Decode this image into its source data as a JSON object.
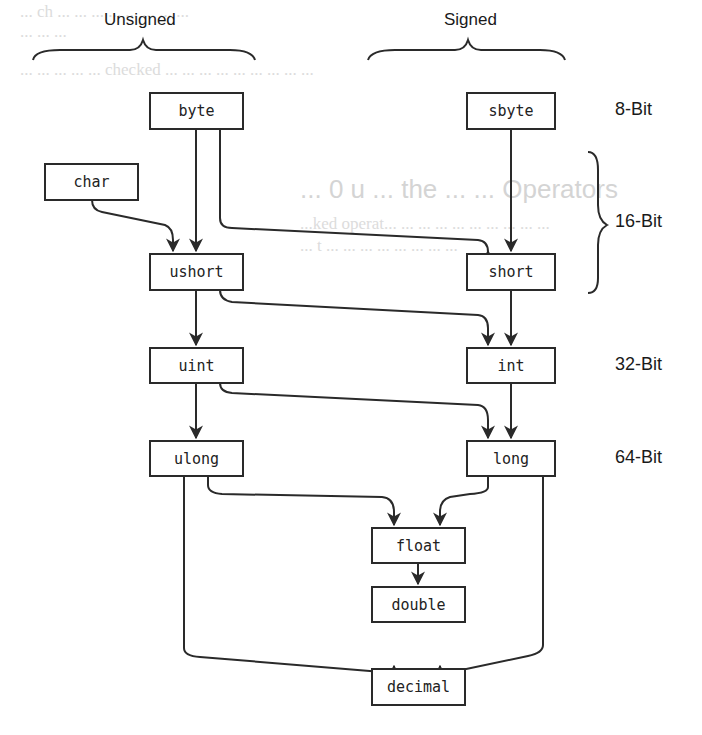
{
  "headers": {
    "unsigned": "Unsigned",
    "signed": "Signed"
  },
  "bit_labels": {
    "b8": "8-Bit",
    "b16": "16-Bit",
    "b32": "32-Bit",
    "b64": "64-Bit"
  },
  "nodes": {
    "byte": "byte",
    "sbyte": "sbyte",
    "char": "char",
    "ushort": "ushort",
    "short": "short",
    "uint": "uint",
    "int": "int",
    "ulong": "ulong",
    "long": "long",
    "float": "float",
    "double": "double",
    "decimal": "decimal"
  },
  "edges": [
    [
      "byte",
      "ushort"
    ],
    [
      "byte",
      "short"
    ],
    [
      "sbyte",
      "short"
    ],
    [
      "char",
      "ushort"
    ],
    [
      "ushort",
      "uint"
    ],
    [
      "ushort",
      "int"
    ],
    [
      "short",
      "int"
    ],
    [
      "uint",
      "ulong"
    ],
    [
      "uint",
      "long"
    ],
    [
      "int",
      "long"
    ],
    [
      "ulong",
      "float"
    ],
    [
      "long",
      "float"
    ],
    [
      "float",
      "double"
    ],
    [
      "ulong",
      "decimal"
    ],
    [
      "long",
      "decimal"
    ]
  ],
  "ghost_text": {
    "line1": "... ch ... ... ... ... ... ... ... ...",
    "line2": "... ... ...",
    "line3": "... ... ... ... ... checked ... ... ... ... ... ... ... ... ...",
    "heading": "... 0 u ... the ... ... Operators",
    "para1": "...ked operat... ... ... ... ... ... ... ... ... ...",
    "para2": "... t ... ... ... ... ... ... ... ..."
  }
}
